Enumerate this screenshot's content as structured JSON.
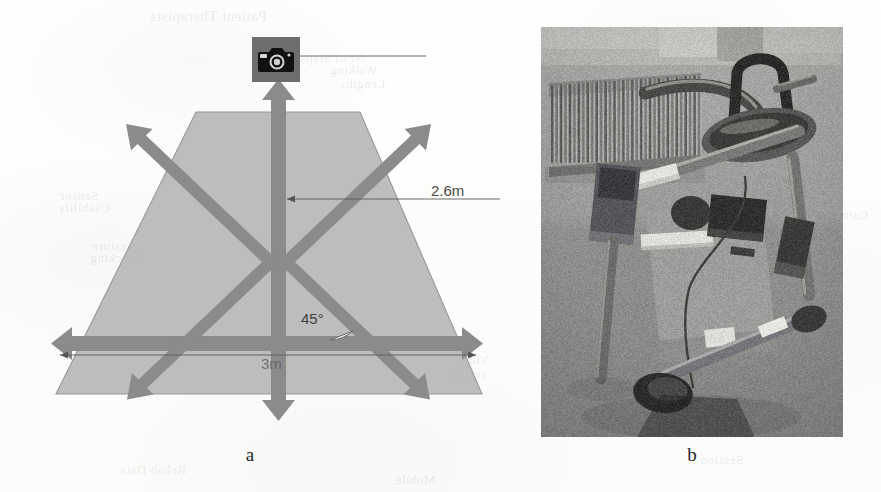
{
  "figure": {
    "panels": [
      {
        "id": "a",
        "caption": "a",
        "kind": "diagram"
      },
      {
        "id": "b",
        "caption": "b",
        "kind": "photograph"
      }
    ]
  },
  "diagram": {
    "camera_icon": "camera-icon",
    "labels": {
      "height": "2.6m",
      "width": "3m",
      "angle": "45°"
    },
    "colors": {
      "field_fill": "#b7b7b7",
      "field_stroke": "#8f8f8f",
      "arrow": "#8a8a8a",
      "dimension_line": "#555555",
      "camera_body": "#6e6e6e",
      "page": "#fdfdfd"
    },
    "arrow_count": 6,
    "arrow_directions": [
      "up",
      "down",
      "left",
      "right",
      "up-left",
      "up-right",
      "down-left",
      "down-right"
    ]
  },
  "photograph": {
    "subject": "wheeled walking-frame / rollator rehabilitation device in a room with a radiator and window",
    "colors": {
      "wall": "#9a9a98",
      "floor": "#8a8a88",
      "frame": "#6a6a68",
      "handle_dark": "#3a3a38",
      "highlight": "#d8d8d4"
    }
  },
  "ghost_text": [
    {
      "text": "Patient Therapists",
      "x": 150,
      "y": 8,
      "size": 15
    },
    {
      "text": "ical Engine",
      "x": 560,
      "y": 38,
      "size": 15
    },
    {
      "text": "Nr of Steps",
      "x": 300,
      "y": 50,
      "size": 13
    },
    {
      "text": "Walking",
      "x": 330,
      "y": 62,
      "size": 13
    },
    {
      "text": "Lengths",
      "x": 340,
      "y": 76,
      "size": 13
    },
    {
      "text": "Speed",
      "x": 620,
      "y": 96,
      "size": 13
    },
    {
      "text": "Sensor",
      "x": 60,
      "y": 188,
      "size": 13
    },
    {
      "text": "Usability",
      "x": 58,
      "y": 200,
      "size": 13
    },
    {
      "text": "Garmin",
      "x": 828,
      "y": 208,
      "size": 12
    },
    {
      "text": "Gesture",
      "x": 92,
      "y": 238,
      "size": 13
    },
    {
      "text": "Tracking",
      "x": 90,
      "y": 250,
      "size": 13
    },
    {
      "text": "Video",
      "x": 455,
      "y": 352,
      "size": 13
    },
    {
      "text": "sensor",
      "x": 450,
      "y": 366,
      "size": 13
    },
    {
      "text": "Session",
      "x": 700,
      "y": 452,
      "size": 13
    },
    {
      "text": "Rehab Data",
      "x": 120,
      "y": 462,
      "size": 13
    },
    {
      "text": "Mobile",
      "x": 395,
      "y": 472,
      "size": 13
    }
  ]
}
